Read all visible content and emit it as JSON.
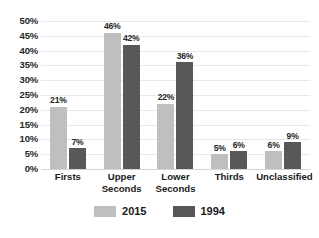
{
  "chart_data": {
    "type": "bar",
    "title": "",
    "subtitle": "",
    "xlabel": "",
    "ylabel": "",
    "grid": true,
    "legend_position": "bottom",
    "ylim": [
      0,
      50
    ],
    "y_ticks": [
      "0%",
      "5%",
      "10%",
      "15%",
      "20%",
      "25%",
      "30%",
      "35%",
      "40%",
      "45%",
      "50%"
    ],
    "y_tick_values": [
      0,
      5,
      10,
      15,
      20,
      25,
      30,
      35,
      40,
      45,
      50
    ],
    "categories": [
      "Firsts",
      "Upper Seconds",
      "Lower Seconds",
      "Thirds",
      "Unclassified"
    ],
    "series": [
      {
        "name": "2015",
        "color": "#bfbfbf",
        "values": [
          21,
          46,
          22,
          5,
          6
        ],
        "labels": [
          "21%",
          "46%",
          "22%",
          "5%",
          "6%"
        ]
      },
      {
        "name": "1994",
        "color": "#585858",
        "values": [
          7,
          42,
          36,
          6,
          9
        ],
        "labels": [
          "7%",
          "42%",
          "36%",
          "6%",
          "9%"
        ]
      }
    ]
  },
  "legend": {
    "items": [
      {
        "label": "2015",
        "color": "#bfbfbf"
      },
      {
        "label": "1994",
        "color": "#585858"
      }
    ]
  }
}
